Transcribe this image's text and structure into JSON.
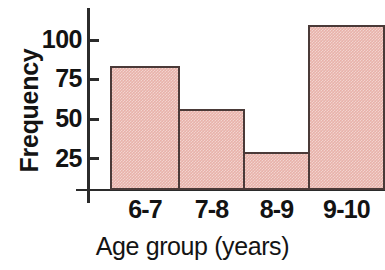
{
  "chart_data": {
    "type": "bar",
    "title": "",
    "xlabel": "Age group (years)",
    "ylabel": "Frequency",
    "categories": [
      "6-7",
      "7-8",
      "8-9",
      "9-10"
    ],
    "values": [
      75,
      49,
      23,
      100
    ],
    "ytick_labels": [
      "100",
      "75",
      "50",
      "25"
    ],
    "ytick_values": [
      100,
      75,
      50,
      25
    ],
    "ylim": [
      0,
      110
    ],
    "grid": false,
    "legend": "none",
    "bar_fill_color": "#e8b2aa",
    "bar_edge_color": "#4a3a38",
    "axis_color": "#2b2b2b",
    "background_color": "#ffffff",
    "series": [
      {
        "name": "Frequency",
        "values": [
          75,
          49,
          23,
          100
        ]
      }
    ]
  }
}
